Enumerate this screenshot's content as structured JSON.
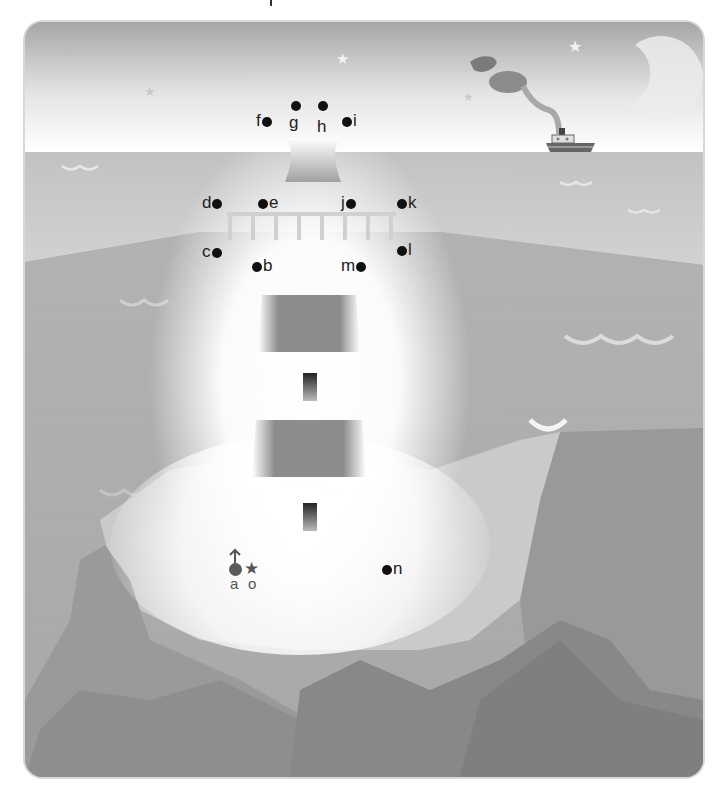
{
  "puzzle": {
    "type": "connect-the-dots",
    "subject": "lighthouse on a cliff at night by the sea",
    "start_marker": {
      "label": "a",
      "icon": "start-arrow"
    },
    "end_marker": {
      "label": "o",
      "icon": "star"
    },
    "points": [
      {
        "label": "a",
        "x": 236,
        "y": 568
      },
      {
        "label": "b",
        "x": 257,
        "y": 265
      },
      {
        "label": "c",
        "x": 218,
        "y": 251
      },
      {
        "label": "d",
        "x": 218,
        "y": 202
      },
      {
        "label": "e",
        "x": 262,
        "y": 202
      },
      {
        "label": "f",
        "x": 270,
        "y": 121
      },
      {
        "label": "g",
        "x": 296,
        "y": 106
      },
      {
        "label": "h",
        "x": 323,
        "y": 106
      },
      {
        "label": "i",
        "x": 346,
        "y": 121
      },
      {
        "label": "j",
        "x": 358,
        "y": 202
      },
      {
        "label": "k",
        "x": 402,
        "y": 202
      },
      {
        "label": "l",
        "x": 402,
        "y": 249
      },
      {
        "label": "m",
        "x": 367,
        "y": 265
      },
      {
        "label": "n",
        "x": 386,
        "y": 568
      },
      {
        "label": "o",
        "x": 254,
        "y": 568
      }
    ]
  },
  "scene": {
    "colors": {
      "sky_top": "#a8a8a8",
      "sky_bottom": "#ffffff",
      "sea": "#b4b4b4",
      "cliff_light": "#c9c9c9",
      "cliff_dark": "#8f8f8f",
      "lighthouse_band": "#8a8a8a",
      "ship_hull": "#666666"
    },
    "elements": [
      "moon",
      "stars",
      "steam-ship",
      "smoke",
      "waves",
      "cliffs",
      "lighthouse-bands",
      "lighthouse-windows",
      "railing"
    ]
  }
}
